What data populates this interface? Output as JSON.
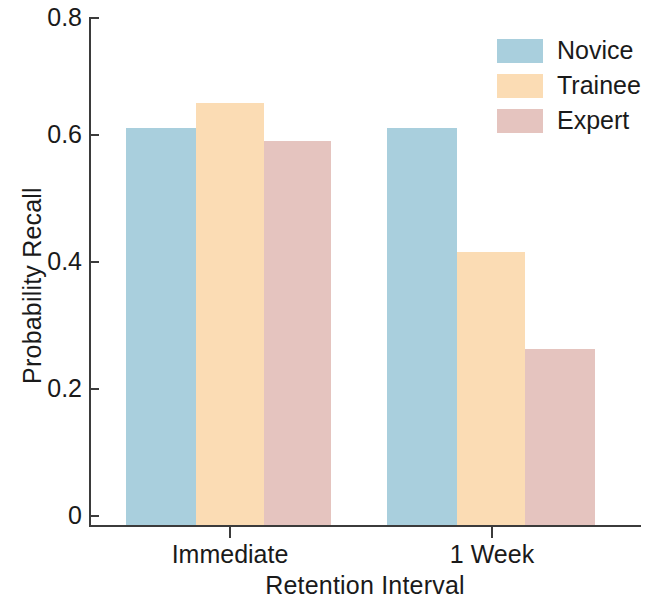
{
  "chart_data": {
    "type": "bar",
    "title": "",
    "xlabel": "Retention Interval",
    "ylabel": "Probability Recall",
    "categories": [
      "Immediate",
      "1 Week"
    ],
    "series": [
      {
        "name": "Novice",
        "color": "#a9cfdd",
        "values": [
          0.625,
          0.625
        ]
      },
      {
        "name": "Trainee",
        "color": "#fbdcb4",
        "values": [
          0.665,
          0.43
        ]
      },
      {
        "name": "Expert",
        "color": "#e5c4bf",
        "values": [
          0.605,
          0.277
        ]
      }
    ],
    "ylim": [
      0,
      0.8
    ],
    "yticks": [
      "0",
      "0.2",
      "0.4",
      "0.6",
      "0.8"
    ],
    "ytick_values": [
      0,
      0.2,
      0.4,
      0.6,
      0.8
    ],
    "grid": false,
    "legend_position": "top-right",
    "legend_entries": [
      "Novice",
      "Trainee",
      "Expert"
    ]
  },
  "axes": {
    "y_title": "Probability Recall",
    "x_title": "Retention Interval",
    "y_tick_labels": [
      "0.8",
      "0.6",
      "0.4",
      "0.2",
      "0"
    ],
    "x_tick_labels": [
      "Immediate",
      "1 Week"
    ]
  },
  "legend": {
    "items": [
      {
        "label": "Novice",
        "color": "#a9cfdd"
      },
      {
        "label": "Trainee",
        "color": "#fbdcb4"
      },
      {
        "label": "Expert",
        "color": "#e5c4bf"
      }
    ]
  }
}
